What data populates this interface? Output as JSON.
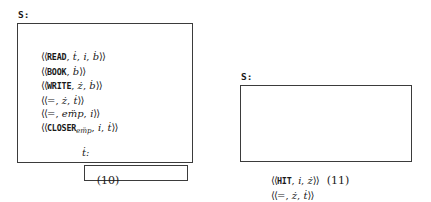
{
  "figure": {
    "panels": [
      {
        "id": "10",
        "caption": "(10)",
        "stack_label": "S:",
        "slot_label": "ṫ:",
        "slot_value": "",
        "tuples": [
          {
            "text": "⟨⟨READ, ṫ, i̇, ḃ⟩⟩",
            "op": "READ",
            "args": [
              "ṫ",
              "i̇",
              "ḃ"
            ]
          },
          {
            "text": "⟨⟨BOOK, ḃ⟩⟩",
            "op": "BOOK",
            "args": [
              "ḃ"
            ]
          },
          {
            "text": "⟨⟨WRITE, ż, ḃ⟩⟩",
            "op": "WRITE",
            "args": [
              "ż",
              "ḃ"
            ]
          },
          {
            "text": "⟨⟨=, ż, ṫ⟩⟩",
            "op": "=",
            "args": [
              "ż",
              "ṫ"
            ]
          },
          {
            "text": "⟨⟨=, em̈p, i̇⟩⟩",
            "op": "=",
            "args": [
              "emp",
              "i̇"
            ]
          },
          {
            "text": "⟨⟨CLOSERemp, i̇, ṫ⟩⟩",
            "op": "CLOSER",
            "subscript": "emp",
            "args": [
              "i̇",
              "ṫ"
            ]
          }
        ]
      },
      {
        "id": "11",
        "caption": "(11)",
        "stack_label": "S:",
        "slot_label": "ṫ:",
        "slot_value": "",
        "tuples": [
          {
            "text": "⟨⟨HIT, i̇, ż⟩⟩",
            "op": "HIT",
            "args": [
              "i̇",
              "ż"
            ]
          },
          {
            "text": "⟨⟨=, ż, ṫ⟩⟩",
            "op": "=",
            "args": [
              "ż",
              "ṫ"
            ]
          }
        ]
      }
    ]
  },
  "colors": {
    "ink": "#1a1a1a",
    "rule": "#3b3b3b",
    "paper": "#ffffff"
  }
}
